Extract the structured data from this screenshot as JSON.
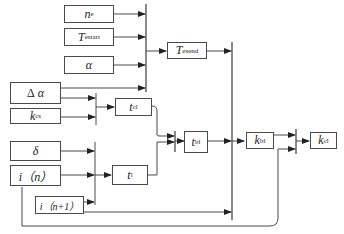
{
  "diagram": {
    "type": "block-diagram",
    "colors": {
      "line": "#4a4a4a",
      "text": "#222222",
      "background": "#ffffff"
    },
    "blocks": [
      {
        "id": "ne",
        "main": "n",
        "sub": "e"
      },
      {
        "id": "tstart",
        "main": "T",
        "sub": "estart"
      },
      {
        "id": "alpha",
        "main": "α",
        "sub": ""
      },
      {
        "id": "tsend",
        "main": "T",
        "sub": "esend"
      },
      {
        "id": "dalpha",
        "prefix": "Δ",
        "main": "α",
        "sub": ""
      },
      {
        "id": "kcs",
        "main": "k",
        "sub": "cs"
      },
      {
        "id": "tcl",
        "main": "t",
        "sub": "cl"
      },
      {
        "id": "delta",
        "main": "δ",
        "sub": ""
      },
      {
        "id": "in",
        "main": "i（n）"
      },
      {
        "id": "in1",
        "main": "i（n+1）"
      },
      {
        "id": "tl",
        "main": "t",
        "sub": "l"
      },
      {
        "id": "tbl",
        "main": "t",
        "sub": "bl"
      },
      {
        "id": "kbl",
        "main": "k",
        "sub": "bl"
      },
      {
        "id": "kcl",
        "main": "k",
        "sub": "cl"
      }
    ],
    "connections": [
      "n_e -> bus1",
      "T_estart -> bus1",
      "α -> bus1",
      "Δα -> bus1",
      "bus1 -> T_esend",
      "T_esend -> bus3",
      "Δα -> bus2a",
      "k_cs -> bus2a",
      "bus2a -> t_cl",
      "δ -> bus2b",
      "i(n) -> bus2b",
      "i(n+1) -> bus2b",
      "bus2b -> t_l",
      "t_cl -> mux_tbl",
      "t_l -> mux_tbl",
      "mux_tbl -> t_bl",
      "t_bl -> bus3",
      "i(n+1) -> bus3",
      "bus3 -> k_bl",
      "k_bl -> mux_kcl",
      "i(n) -> mux_kcl",
      "mux_kcl -> k_cl"
    ]
  }
}
